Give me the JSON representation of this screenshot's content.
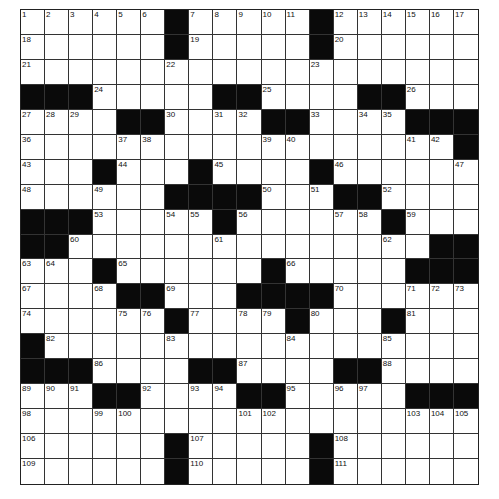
{
  "puzzle": {
    "rows_count": 19,
    "cols_count": 19,
    "grid": [
      "......#.....#......",
      "......#.....#......",
      "...................",
      "###.....##....##...",
      "....##....##....###",
      "..................#",
      "...#...#....#.....",
      "......####...##....",
      "###.....#......#...",
      "##...............##",
      "...#......#.....###",
      "....##...####......",
      "......#....#...#...",
      "#..................",
      "###......##....##...",
      "...##.....##.....###",
      "...................",
      "......#.....#......",
      "......#.....#......"
    ],
    "black_cells": {
      "0": [
        6,
        12
      ],
      "1": [
        6,
        12
      ],
      "2": [],
      "3": [
        0,
        1,
        2,
        8,
        9,
        14,
        15
      ],
      "4": [
        4,
        5,
        10,
        11,
        16,
        17,
        18
      ],
      "5": [
        18
      ],
      "6": [
        3,
        7,
        12
      ],
      "7": [
        6,
        7,
        8,
        9,
        13,
        14
      ],
      "8": [
        0,
        1,
        2,
        8,
        15
      ],
      "9": [
        0,
        1,
        17,
        18
      ],
      "10": [
        3,
        10,
        16,
        17,
        18
      ],
      "11": [
        4,
        5,
        9,
        10,
        11,
        12
      ],
      "12": [
        6,
        11,
        15
      ],
      "13": [
        0
      ],
      "14": [
        0,
        1,
        2,
        7,
        8,
        13,
        14
      ],
      "15": [
        3,
        4,
        9,
        10,
        16,
        17,
        18
      ],
      "16": [],
      "17": [
        6,
        12
      ],
      "18": [
        6,
        12
      ]
    },
    "numbers": [
      {
        "n": 1,
        "r": 0,
        "c": 0
      },
      {
        "n": 2,
        "r": 0,
        "c": 1
      },
      {
        "n": 3,
        "r": 0,
        "c": 2
      },
      {
        "n": 4,
        "r": 0,
        "c": 3
      },
      {
        "n": 5,
        "r": 0,
        "c": 4
      },
      {
        "n": 6,
        "r": 0,
        "c": 5
      },
      {
        "n": 7,
        "r": 0,
        "c": 7
      },
      {
        "n": 8,
        "r": 0,
        "c": 8
      },
      {
        "n": 9,
        "r": 0,
        "c": 9
      },
      {
        "n": 10,
        "r": 0,
        "c": 10
      },
      {
        "n": 11,
        "r": 0,
        "c": 11
      },
      {
        "n": 12,
        "r": 0,
        "c": 13
      },
      {
        "n": 13,
        "r": 0,
        "c": 14
      },
      {
        "n": 14,
        "r": 0,
        "c": 15
      },
      {
        "n": 15,
        "r": 0,
        "c": 16
      },
      {
        "n": 16,
        "r": 0,
        "c": 17
      },
      {
        "n": 17,
        "r": 0,
        "c": 18
      },
      {
        "n": 18,
        "r": 1,
        "c": 0
      },
      {
        "n": 19,
        "r": 1,
        "c": 7
      },
      {
        "n": 20,
        "r": 1,
        "c": 13
      },
      {
        "n": 21,
        "r": 2,
        "c": 0
      },
      {
        "n": 22,
        "r": 2,
        "c": 6
      },
      {
        "n": 23,
        "r": 2,
        "c": 12
      },
      {
        "n": 24,
        "r": 3,
        "c": 3
      },
      {
        "n": 25,
        "r": 3,
        "c": 10
      },
      {
        "n": 26,
        "r": 3,
        "c": 16
      },
      {
        "n": 27,
        "r": 4,
        "c": 0
      },
      {
        "n": 28,
        "r": 4,
        "c": 1
      },
      {
        "n": 29,
        "r": 4,
        "c": 2
      },
      {
        "n": 30,
        "r": 4,
        "c": 6
      },
      {
        "n": 31,
        "r": 4,
        "c": 8
      },
      {
        "n": 32,
        "r": 4,
        "c": 9
      },
      {
        "n": 33,
        "r": 4,
        "c": 12
      },
      {
        "n": 34,
        "r": 4,
        "c": 14
      },
      {
        "n": 35,
        "r": 4,
        "c": 15
      },
      {
        "n": 36,
        "r": 5,
        "c": 0
      },
      {
        "n": 37,
        "r": 5,
        "c": 4
      },
      {
        "n": 38,
        "r": 5,
        "c": 5
      },
      {
        "n": 39,
        "r": 5,
        "c": 10
      },
      {
        "n": 40,
        "r": 5,
        "c": 11
      },
      {
        "n": 41,
        "r": 5,
        "c": 16
      },
      {
        "n": 42,
        "r": 5,
        "c": 17
      },
      {
        "n": 43,
        "r": 6,
        "c": 0
      },
      {
        "n": 44,
        "r": 6,
        "c": 4
      },
      {
        "n": 45,
        "r": 6,
        "c": 8
      },
      {
        "n": 46,
        "r": 6,
        "c": 13
      },
      {
        "n": 47,
        "r": 6,
        "c": 18
      },
      {
        "n": 48,
        "r": 7,
        "c": 0
      },
      {
        "n": 49,
        "r": 7,
        "c": 3
      },
      {
        "n": 50,
        "r": 7,
        "c": 10
      },
      {
        "n": 51,
        "r": 7,
        "c": 12
      },
      {
        "n": 52,
        "r": 7,
        "c": 15
      },
      {
        "n": 53,
        "r": 8,
        "c": 3
      },
      {
        "n": 54,
        "r": 8,
        "c": 6
      },
      {
        "n": 55,
        "r": 8,
        "c": 7
      },
      {
        "n": 56,
        "r": 8,
        "c": 9
      },
      {
        "n": 57,
        "r": 8,
        "c": 13
      },
      {
        "n": 58,
        "r": 8,
        "c": 14
      },
      {
        "n": 59,
        "r": 8,
        "c": 16
      },
      {
        "n": 60,
        "r": 9,
        "c": 2
      },
      {
        "n": 61,
        "r": 9,
        "c": 8
      },
      {
        "n": 62,
        "r": 9,
        "c": 15
      },
      {
        "n": 63,
        "r": 10,
        "c": 0
      },
      {
        "n": 64,
        "r": 10,
        "c": 1
      },
      {
        "n": 65,
        "r": 10,
        "c": 4
      },
      {
        "n": 66,
        "r": 10,
        "c": 11
      },
      {
        "n": 67,
        "r": 11,
        "c": 0
      },
      {
        "n": 68,
        "r": 11,
        "c": 3
      },
      {
        "n": 69,
        "r": 11,
        "c": 6
      },
      {
        "n": 70,
        "r": 11,
        "c": 13
      },
      {
        "n": 71,
        "r": 11,
        "c": 16
      },
      {
        "n": 72,
        "r": 11,
        "c": 17
      },
      {
        "n": 73,
        "r": 11,
        "c": 18
      },
      {
        "n": 74,
        "r": 12,
        "c": 0
      },
      {
        "n": 75,
        "r": 12,
        "c": 4
      },
      {
        "n": 76,
        "r": 12,
        "c": 5
      },
      {
        "n": 77,
        "r": 12,
        "c": 7
      },
      {
        "n": 78,
        "r": 12,
        "c": 9
      },
      {
        "n": 79,
        "r": 12,
        "c": 10
      },
      {
        "n": 80,
        "r": 12,
        "c": 12
      },
      {
        "n": 81,
        "r": 12,
        "c": 16
      },
      {
        "n": 82,
        "r": 13,
        "c": 1
      },
      {
        "n": 83,
        "r": 13,
        "c": 6
      },
      {
        "n": 84,
        "r": 13,
        "c": 11
      },
      {
        "n": 85,
        "r": 13,
        "c": 15
      },
      {
        "n": 86,
        "r": 14,
        "c": 3
      },
      {
        "n": 87,
        "r": 14,
        "c": 9
      },
      {
        "n": 88,
        "r": 14,
        "c": 15
      },
      {
        "n": 89,
        "r": 15,
        "c": 0
      },
      {
        "n": 90,
        "r": 15,
        "c": 1
      },
      {
        "n": 91,
        "r": 15,
        "c": 2
      },
      {
        "n": 92,
        "r": 15,
        "c": 5
      },
      {
        "n": 93,
        "r": 15,
        "c": 7
      },
      {
        "n": 94,
        "r": 15,
        "c": 8
      },
      {
        "n": 95,
        "r": 15,
        "c": 11
      },
      {
        "n": 96,
        "r": 15,
        "c": 13
      },
      {
        "n": 97,
        "r": 15,
        "c": 14
      },
      {
        "n": 98,
        "r": 16,
        "c": 0
      },
      {
        "n": 99,
        "r": 16,
        "c": 3
      },
      {
        "n": 100,
        "r": 16,
        "c": 4
      },
      {
        "n": 101,
        "r": 16,
        "c": 9
      },
      {
        "n": 102,
        "r": 16,
        "c": 10
      },
      {
        "n": 103,
        "r": 16,
        "c": 16
      },
      {
        "n": 104,
        "r": 16,
        "c": 17
      },
      {
        "n": 105,
        "r": 16,
        "c": 18
      },
      {
        "n": 106,
        "r": 17,
        "c": 0
      },
      {
        "n": 107,
        "r": 17,
        "c": 7
      },
      {
        "n": 108,
        "r": 17,
        "c": 13
      },
      {
        "n": 109,
        "r": 18,
        "c": 0
      },
      {
        "n": 110,
        "r": 18,
        "c": 7
      },
      {
        "n": 111,
        "r": 18,
        "c": 13
      }
    ],
    "colors": {
      "black_cell": "#0a0a0a",
      "white_cell": "#ffffff",
      "grid_line": "#333333"
    }
  }
}
